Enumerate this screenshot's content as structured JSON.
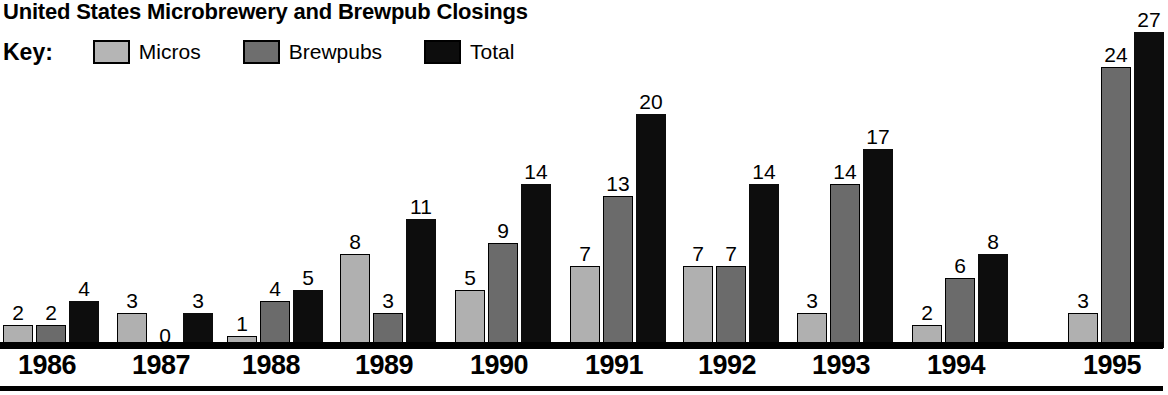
{
  "title": "United States Microbrewery and Brewpub Closings",
  "legend": {
    "key_label": "Key:",
    "items": [
      {
        "label": "Micros",
        "swatch": "light-gray-swatch",
        "color": "#b0b0b0"
      },
      {
        "label": "Brewpubs",
        "swatch": "dark-gray-swatch",
        "color": "#6b6b6b"
      },
      {
        "label": "Total",
        "swatch": "black-swatch",
        "color": "#0d0d0d"
      }
    ]
  },
  "chart_data": {
    "type": "bar",
    "title": "United States Microbrewery and Brewpub Closings",
    "xlabel": "",
    "ylabel": "",
    "grid": false,
    "legend_position": "top-left",
    "axis_visible": "x-only",
    "ylim": [
      0,
      27
    ],
    "categories": [
      "1986",
      "1987",
      "1988",
      "1989",
      "1990",
      "1991",
      "1992",
      "1993",
      "1994",
      "1995"
    ],
    "series": [
      {
        "name": "Micros",
        "color": "#b0b0b0",
        "values": [
          2,
          3,
          1,
          8,
          5,
          7,
          7,
          3,
          2,
          3
        ]
      },
      {
        "name": "Brewpubs",
        "color": "#6b6b6b",
        "values": [
          2,
          0,
          4,
          3,
          9,
          13,
          7,
          14,
          6,
          24
        ]
      },
      {
        "name": "Total",
        "color": "#0d0d0d",
        "values": [
          4,
          3,
          5,
          11,
          14,
          20,
          14,
          17,
          8,
          27
        ]
      }
    ],
    "data_labels": [
      {
        "category": "1986",
        "Micros": "2",
        "Brewpubs": "2",
        "Total": "4"
      },
      {
        "category": "1987",
        "Micros": "3",
        "Brewpubs": "0",
        "Total": "3"
      },
      {
        "category": "1988",
        "Micros": "1",
        "Brewpubs": "4",
        "Total": "5"
      },
      {
        "category": "1989",
        "Micros": "8",
        "Brewpubs": "3",
        "Total": "11"
      },
      {
        "category": "1990",
        "Micros": "5",
        "Brewpubs": "9",
        "Total": "14"
      },
      {
        "category": "1991",
        "Micros": "7",
        "Brewpubs": "13",
        "Total": "20"
      },
      {
        "category": "1992",
        "Micros": "7",
        "Brewpubs": "7",
        "Total": "14"
      },
      {
        "category": "1993",
        "Micros": "3",
        "Brewpubs": "14",
        "Total": "17"
      },
      {
        "category": "1994",
        "Micros": "2",
        "Brewpubs": "6",
        "Total": "8"
      },
      {
        "category": "1995",
        "Micros": "3",
        "Brewpubs": "24",
        "Total": "27"
      }
    ]
  },
  "layout": {
    "unit_px": 11.7,
    "bar_width_px": 30,
    "bar_gap_px": 3,
    "group_width_px": 110,
    "group_left_px": [
      3,
      117,
      227,
      340,
      455,
      570,
      683,
      797,
      912,
      1068
    ],
    "group_left_px_micros_override_1995": 1071,
    "baseline_top_px": 342,
    "label_offset_px": 24
  }
}
